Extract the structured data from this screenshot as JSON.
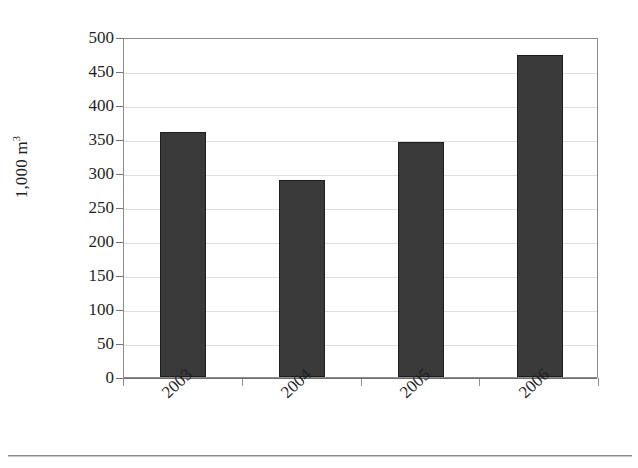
{
  "chart_data": {
    "type": "bar",
    "title": "",
    "subtitle": "",
    "xlabel": "",
    "ylabel": "1,000 m",
    "ylabel_superscript": "3",
    "categories": [
      "2003",
      "2004",
      "2005",
      "2006"
    ],
    "values": [
      360,
      290,
      346,
      473
    ],
    "series": [
      {
        "name": "Volume",
        "values": [
          360,
          290,
          346,
          473
        ]
      }
    ],
    "ylim": [
      0,
      500
    ],
    "y_ticks": [
      0,
      50,
      100,
      150,
      200,
      250,
      300,
      350,
      400,
      450,
      500
    ],
    "y_tick_labels": [
      "0",
      "50",
      "100",
      "150",
      "200",
      "250",
      "300",
      "350",
      "400",
      "450",
      "500"
    ],
    "grid": true,
    "grid_axis": "y",
    "legend": false,
    "legend_position": "none",
    "bar_color": "#3a3a3a",
    "bar_border_color": "#1e1e1e",
    "gridline_color": "#dedede",
    "axis_color": "#8c8c8c",
    "plot_background": "#ffffff",
    "xtick_label_rotation": -43,
    "ylabel_rotation": -90,
    "annotations": []
  },
  "figure": {
    "background": "#ffffff",
    "bottom_rule_color": "#8a8a8a"
  }
}
